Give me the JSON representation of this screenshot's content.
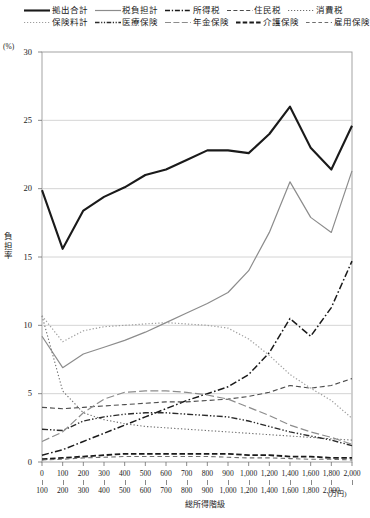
{
  "chart_data": {
    "type": "line",
    "title": "",
    "xlabel": "総所得階級",
    "xunit": "(万円)",
    "ylabel": "負担率",
    "yunit": "(%)",
    "ylim": [
      0,
      30
    ],
    "yticks": [
      0,
      5,
      10,
      15,
      20,
      25,
      30
    ],
    "grid": true,
    "legend_position": "top",
    "categories": [
      "0\n100",
      "100\n200",
      "200\n300",
      "300\n400",
      "400\n500",
      "500\n600",
      "600\n700",
      "700\n800",
      "800\n900",
      "900\n1,000",
      "1,000\n1,200",
      "1,200\n1,400",
      "1,400\n1,600",
      "1,600\n1,800",
      "1,800\n2,000",
      "2,000\n"
    ],
    "x_lower": [
      "0",
      "100",
      "200",
      "300",
      "400",
      "500",
      "600",
      "700",
      "800",
      "900",
      "1,000",
      "1,200",
      "1,400",
      "1,600",
      "1,800",
      "2,000"
    ],
    "x_upper": [
      "100",
      "200",
      "300",
      "400",
      "500",
      "600",
      "700",
      "800",
      "900",
      "1,000",
      "1,200",
      "1,400",
      "1,600",
      "1,800",
      "2,000",
      ""
    ],
    "series": [
      {
        "name": "拠出合計",
        "style": "solid-thick",
        "color": "#1a1a1a",
        "width": 2.1,
        "values": [
          19.9,
          15.6,
          18.4,
          19.4,
          20.1,
          21.0,
          21.4,
          22.1,
          22.8,
          22.8,
          22.6,
          24.0,
          26.0,
          23.0,
          21.4,
          24.6
        ]
      },
      {
        "name": "税負担計",
        "style": "solid-thin",
        "color": "#8c8c8c",
        "width": 1.2,
        "values": [
          9.2,
          6.9,
          7.9,
          8.4,
          8.9,
          9.5,
          10.2,
          10.9,
          11.6,
          12.4,
          14.0,
          16.8,
          20.5,
          17.9,
          16.8,
          21.3
        ]
      },
      {
        "name": "所得税",
        "style": "dash-dot",
        "color": "#1a1a1a",
        "width": 1.5,
        "values": [
          0.5,
          0.9,
          1.5,
          2.1,
          2.7,
          3.3,
          3.9,
          4.5,
          5.0,
          5.5,
          6.4,
          8.0,
          10.5,
          9.2,
          11.3,
          14.7
        ]
      },
      {
        "name": "住民税",
        "style": "dash",
        "color": "#4d4d4d",
        "width": 1.1,
        "values": [
          4.0,
          3.9,
          4.0,
          4.1,
          4.2,
          4.3,
          4.4,
          4.4,
          4.5,
          4.6,
          4.8,
          5.1,
          5.6,
          5.4,
          5.6,
          6.1
        ]
      },
      {
        "name": "消費税",
        "style": "dot",
        "color": "#6e6e6e",
        "width": 1.1,
        "values": [
          10.7,
          5.2,
          3.6,
          3.1,
          2.8,
          2.6,
          2.5,
          2.4,
          2.3,
          2.2,
          2.1,
          2.0,
          1.9,
          1.8,
          1.7,
          1.6
        ]
      },
      {
        "name": "保険料計",
        "style": "dot-light",
        "color": "#9e9e9e",
        "width": 1.2,
        "values": [
          10.7,
          8.8,
          9.6,
          9.9,
          10.0,
          10.1,
          10.2,
          10.1,
          10.0,
          9.8,
          9.0,
          7.8,
          6.4,
          5.4,
          4.5,
          3.2
        ]
      },
      {
        "name": "医療保険",
        "style": "dash-dot-dot",
        "color": "#2b2b2b",
        "width": 1.4,
        "values": [
          2.4,
          2.3,
          3.0,
          3.3,
          3.5,
          3.6,
          3.6,
          3.5,
          3.4,
          3.3,
          3.0,
          2.6,
          2.2,
          1.9,
          1.6,
          1.2
        ]
      },
      {
        "name": "年金保険",
        "style": "long-dash",
        "color": "#8c8c8c",
        "width": 1.2,
        "values": [
          1.5,
          2.2,
          3.6,
          4.6,
          5.1,
          5.2,
          5.2,
          5.1,
          4.9,
          4.6,
          4.0,
          3.4,
          2.7,
          2.2,
          1.8,
          1.3
        ]
      },
      {
        "name": "介護保険",
        "style": "dash-heavy",
        "color": "#1a1a1a",
        "width": 1.8,
        "values": [
          0.2,
          0.3,
          0.4,
          0.5,
          0.6,
          0.6,
          0.6,
          0.6,
          0.6,
          0.6,
          0.5,
          0.5,
          0.4,
          0.4,
          0.3,
          0.3
        ]
      },
      {
        "name": "雇用保険",
        "style": "dash-med",
        "color": "#6e6e6e",
        "width": 1.1,
        "values": [
          0.15,
          0.2,
          0.3,
          0.35,
          0.4,
          0.4,
          0.4,
          0.4,
          0.4,
          0.35,
          0.3,
          0.3,
          0.25,
          0.2,
          0.2,
          0.15
        ]
      }
    ]
  },
  "legend": {
    "rows": [
      [
        {
          "name": "拠出合計",
          "style": "solid-thick"
        },
        {
          "name": "税負担計",
          "style": "solid-thin"
        },
        {
          "name": "所得税",
          "style": "dash-dot"
        },
        {
          "name": "住民税",
          "style": "dash"
        },
        {
          "name": "消費税",
          "style": "dot"
        }
      ],
      [
        {
          "name": "保険料計",
          "style": "dot-light"
        },
        {
          "name": "医療保険",
          "style": "dash-dot-dot"
        },
        {
          "name": "年金保険",
          "style": "long-dash"
        },
        {
          "name": "介護保険",
          "style": "dash-heavy"
        },
        {
          "name": "雇用保険",
          "style": "dash-med"
        }
      ]
    ]
  }
}
